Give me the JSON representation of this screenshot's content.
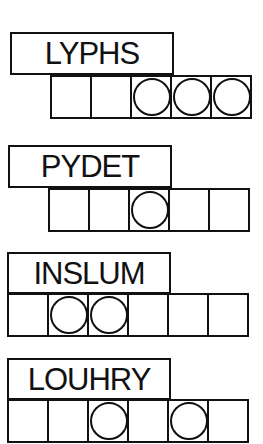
{
  "puzzles": [
    {
      "scrambled": "LYPHS",
      "cells": 5,
      "circled": [
        3,
        4,
        5
      ]
    },
    {
      "scrambled": "PYDET",
      "cells": 5,
      "circled": [
        3
      ]
    },
    {
      "scrambled": "INSLUM",
      "cells": 6,
      "circled": [
        2,
        3
      ]
    },
    {
      "scrambled": "LOUHRY",
      "cells": 6,
      "circled": [
        3,
        5
      ]
    }
  ]
}
